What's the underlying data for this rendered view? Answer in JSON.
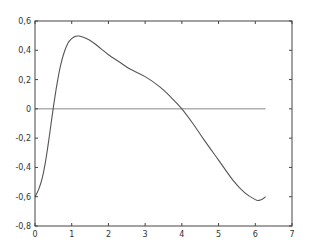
{
  "chart_data": {
    "type": "line",
    "title": "",
    "xlabel": "",
    "ylabel": "",
    "xlim": [
      0,
      7
    ],
    "ylim": [
      -0.8,
      0.6
    ],
    "grid": false,
    "legend": null,
    "xticks": [
      0,
      1,
      2,
      3,
      4,
      5,
      6,
      7
    ],
    "yticks": [
      0.6,
      0.4,
      0.2,
      0,
      -0.2,
      -0.4,
      -0.6,
      -0.8
    ],
    "xtick_labels": [
      "0",
      "1",
      "2",
      "3",
      "4",
      "5",
      "6",
      "7"
    ],
    "ytick_labels": [
      "0,6",
      "0,4",
      "0,2",
      "0",
      "-0,2",
      "-0,4",
      "-0,6",
      "-0,8"
    ],
    "series": [
      {
        "name": "curve",
        "color": "#555555",
        "x": [
          0,
          0.1,
          0.2,
          0.3,
          0.4,
          0.5,
          0.6,
          0.7,
          0.8,
          0.9,
          1.0,
          1.1,
          1.2,
          1.4,
          1.6,
          1.8,
          2.0,
          2.3,
          2.6,
          3.0,
          3.4,
          3.7,
          4.0,
          4.3,
          4.6,
          5.0,
          5.4,
          5.7,
          6.0,
          6.1,
          6.2,
          6.28
        ],
        "y": [
          -0.6,
          -0.55,
          -0.47,
          -0.34,
          -0.17,
          0.01,
          0.17,
          0.3,
          0.39,
          0.45,
          0.48,
          0.495,
          0.497,
          0.48,
          0.45,
          0.41,
          0.37,
          0.32,
          0.27,
          0.22,
          0.15,
          0.08,
          0.0,
          -0.1,
          -0.21,
          -0.35,
          -0.49,
          -0.57,
          -0.62,
          -0.625,
          -0.615,
          -0.6
        ]
      },
      {
        "name": "zero-line",
        "color": "#888888",
        "x": [
          0,
          6.28
        ],
        "y": [
          0,
          0
        ]
      }
    ]
  }
}
